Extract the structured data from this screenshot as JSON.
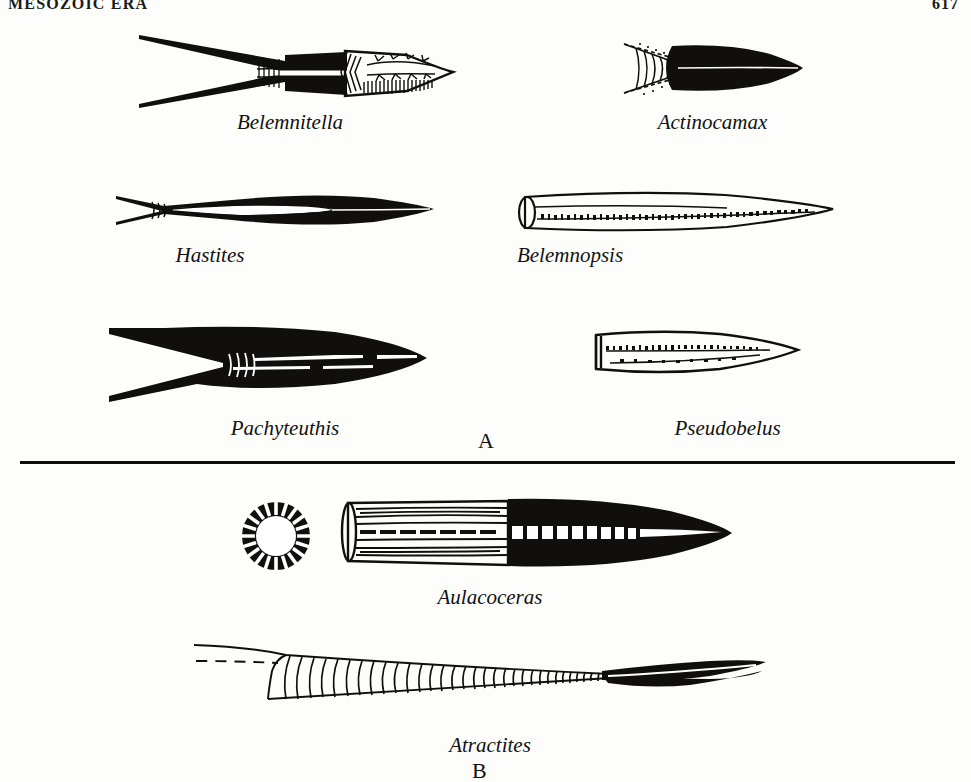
{
  "page": {
    "running_head": "MESOZOIC ERA",
    "folio": "617",
    "background_color": "#fdfdfb",
    "ink_color": "#100f0d"
  },
  "figure": {
    "panels": [
      {
        "label": "A",
        "label_position": {
          "x": 478,
          "y": 428
        },
        "description": "Belemnitida guards",
        "specimens": [
          {
            "name": "Belemnitella",
            "caption_x": 290,
            "caption_y": 122,
            "art_x": 135,
            "art_y": 25
          },
          {
            "name": "Actinocamax",
            "caption_x": 712,
            "caption_y": 122,
            "art_x": 620,
            "art_y": 38
          },
          {
            "name": "Hastites",
            "caption_x": 210,
            "caption_y": 255,
            "art_x": 112,
            "art_y": 178
          },
          {
            "name": "Belemnopsis",
            "caption_x": 570,
            "caption_y": 255,
            "art_x": 515,
            "art_y": 185
          },
          {
            "name": "Pachyteuthis",
            "caption_x": 283,
            "caption_y": 428,
            "art_x": 105,
            "art_y": 322
          },
          {
            "name": "Pseudobelus",
            "caption_x": 727,
            "caption_y": 428,
            "art_x": 590,
            "art_y": 325
          }
        ]
      },
      {
        "label": "B",
        "label_position": {
          "x": 478,
          "y": 762
        },
        "description": "Aulacocerida",
        "specimens": [
          {
            "name": "Aulacoceras",
            "caption_x": 490,
            "caption_y": 597,
            "art_x": 230,
            "art_y": 495
          },
          {
            "name": "Atractites",
            "caption_x": 490,
            "caption_y": 745,
            "art_x": 190,
            "art_y": 635
          }
        ]
      }
    ],
    "divider": {
      "x": 20,
      "y": 461,
      "width": 935,
      "thickness": 3
    }
  }
}
